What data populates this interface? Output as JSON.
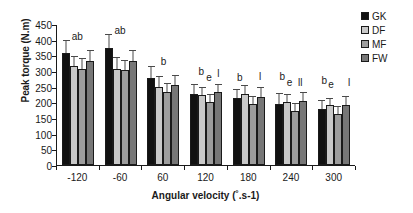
{
  "chart_data": {
    "type": "bar",
    "title": "",
    "xlabel": "Angular velocity (˚.s-1)",
    "ylabel": "Peak torque (N.m)",
    "categories": [
      "-120",
      "-60",
      "60",
      "120",
      "180",
      "240",
      "300"
    ],
    "ylim": [
      0,
      450
    ],
    "ytick_values": [
      0,
      50,
      100,
      150,
      200,
      250,
      300,
      350,
      400,
      450
    ],
    "ytick_labels": [
      "0",
      "50",
      "100",
      "150",
      "200",
      "250",
      "300",
      "350",
      "400",
      "450"
    ],
    "grid": false,
    "legend_position": "top-right",
    "series": [
      {
        "name": "GK",
        "color": "#111111",
        "values": [
          358,
          375,
          278,
          228,
          213,
          196,
          178
        ],
        "errors": [
          42,
          44,
          37,
          30,
          30,
          33,
          30
        ]
      },
      {
        "name": "DF",
        "color": "#c9c9c9",
        "values": [
          315,
          308,
          250,
          222,
          228,
          200,
          190
        ],
        "errors": [
          33,
          36,
          33,
          26,
          28,
          28,
          25
        ]
      },
      {
        "name": "MF",
        "color": "#9d9d9d",
        "values": [
          308,
          303,
          233,
          202,
          196,
          172,
          163
        ],
        "errors": [
          33,
          33,
          30,
          25,
          25,
          26,
          26
        ]
      },
      {
        "name": "FW",
        "color": "#777777",
        "values": [
          331,
          331,
          255,
          232,
          218,
          203,
          192
        ],
        "errors": [
          35,
          36,
          33,
          28,
          30,
          30,
          28
        ]
      }
    ],
    "annotations": [
      {
        "category": "-120",
        "text": "ab",
        "x_frac": 0.5,
        "y_value": 432
      },
      {
        "category": "-60",
        "text": "ab",
        "x_frac": 0.5,
        "y_value": 450
      },
      {
        "category": "60",
        "text": "b",
        "x_frac": 0.52,
        "y_value": 352
      },
      {
        "category": "120",
        "text": "b",
        "x_frac": 0.4,
        "y_value": 318
      },
      {
        "category": "120",
        "text": "e",
        "x_frac": 0.58,
        "y_value": 300
      },
      {
        "category": "120",
        "text": "l",
        "x_frac": 0.8,
        "y_value": 312
      },
      {
        "category": "180",
        "text": "b",
        "x_frac": 0.3,
        "y_value": 300
      },
      {
        "category": "180",
        "text": "l",
        "x_frac": 0.78,
        "y_value": 302
      },
      {
        "category": "240",
        "text": "b",
        "x_frac": 0.3,
        "y_value": 302
      },
      {
        "category": "240",
        "text": "e",
        "x_frac": 0.47,
        "y_value": 285
      },
      {
        "category": "240",
        "text": "ll",
        "x_frac": 0.72,
        "y_value": 285
      },
      {
        "category": "300",
        "text": "b",
        "x_frac": 0.28,
        "y_value": 292
      },
      {
        "category": "300",
        "text": "e",
        "x_frac": 0.44,
        "y_value": 278
      },
      {
        "category": "300",
        "text": "l",
        "x_frac": 0.86,
        "y_value": 285
      }
    ]
  },
  "legend": {
    "items": [
      {
        "label": "GK"
      },
      {
        "label": "DF"
      },
      {
        "label": "MF"
      },
      {
        "label": "FW"
      }
    ]
  }
}
